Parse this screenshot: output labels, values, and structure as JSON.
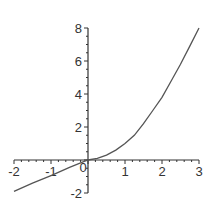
{
  "chart_data": {
    "type": "line",
    "title": "",
    "xlabel": "",
    "ylabel": "",
    "xlim": [
      -2,
      3
    ],
    "ylim": [
      -2,
      8
    ],
    "grid": false,
    "legend": null,
    "x_ticks": [
      "-2",
      "-1",
      "0",
      "1",
      "2",
      "3"
    ],
    "y_ticks": [
      "-2",
      "2",
      "4",
      "6",
      "8"
    ],
    "series": [
      {
        "name": "f(x)",
        "x": [
          -2,
          -1.5,
          -1,
          -0.5,
          0,
          0.25,
          0.5,
          0.75,
          1,
          1.25,
          1.5,
          1.75,
          2,
          2.25,
          2.5,
          2.75,
          3
        ],
        "values": [
          -1.9,
          -1.4,
          -0.95,
          -0.45,
          0,
          0.1,
          0.3,
          0.6,
          1.0,
          1.5,
          2.2,
          3.0,
          3.8,
          4.8,
          5.8,
          6.9,
          8.0
        ]
      }
    ],
    "line_color": "#555555",
    "axis_color": "#333333"
  }
}
